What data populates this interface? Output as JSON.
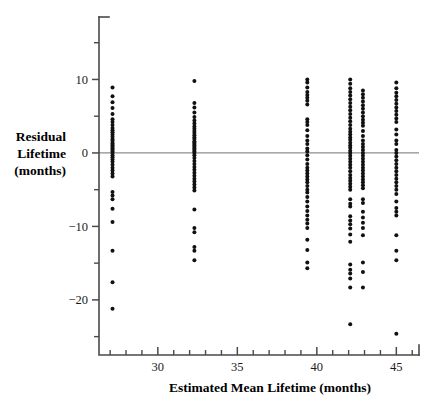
{
  "chart_data": {
    "type": "scatter",
    "title": "",
    "xlabel": "Estimated Mean Lifetime (months)",
    "ylabel": "Residual Lifetime (months)",
    "ylabel_lines": [
      "Residual",
      "Lifetime",
      "(months)"
    ],
    "xlim": [
      26.3,
      46.3
    ],
    "ylim": [
      -27.5,
      18.5
    ],
    "grid": false,
    "legend": null,
    "reference_lines": [
      {
        "orientation": "horizontal",
        "value": 0,
        "color": "#8d8d8d"
      }
    ],
    "xticks_major": [
      30,
      35,
      40,
      45
    ],
    "xticks_major_labels": [
      "30",
      "35",
      "40",
      "45"
    ],
    "xticks_minor": [
      27,
      28,
      29,
      31,
      32,
      33,
      34,
      36,
      37,
      38,
      39,
      41,
      42,
      43,
      44,
      46
    ],
    "yticks_major": [
      10,
      0,
      -10,
      -20
    ],
    "yticks_major_labels": [
      "10",
      "0",
      "−10",
      "−20"
    ],
    "yticks_minor": [
      15,
      5,
      -5,
      -15,
      -25
    ],
    "point_color": "#111111",
    "point_radius": 2.0,
    "series": [
      {
        "name": "Group 27.1",
        "x": 27.15,
        "values": [
          8.9,
          7.7,
          6.9,
          6.1,
          5.3,
          4.6,
          4.2,
          3.8,
          3.4,
          3.1,
          2.8,
          2.5,
          2.2,
          1.9,
          1.7,
          1.4,
          1.2,
          1.0,
          0.8,
          0.6,
          0.4,
          0.2,
          0.0,
          -0.3,
          -0.6,
          -0.9,
          -1.2,
          -1.6,
          -2.0,
          -2.4,
          -2.8,
          -3.2,
          -5.3,
          -5.8,
          -6.3,
          -7.6,
          -9.4,
          -13.3,
          -17.6,
          -21.2
        ]
      },
      {
        "name": "Group 32.3",
        "x": 32.3,
        "values": [
          9.8,
          6.8,
          6.2,
          5.5,
          4.9,
          4.4,
          4.0,
          3.6,
          3.3,
          3.0,
          2.7,
          2.4,
          2.1,
          1.9,
          1.6,
          1.4,
          1.2,
          1.0,
          0.8,
          0.6,
          0.4,
          0.2,
          0.0,
          -0.3,
          -0.7,
          -1.1,
          -1.5,
          -1.9,
          -2.3,
          -2.7,
          -3.1,
          -3.5,
          -3.9,
          -4.3,
          -4.7,
          -5.1,
          -7.7,
          -10.2,
          -10.8,
          -12.8,
          -13.3,
          -14.6
        ]
      },
      {
        "name": "Group 39.4",
        "x": 39.4,
        "values": [
          10.0,
          9.6,
          8.9,
          8.3,
          7.9,
          7.5,
          7.1,
          6.6,
          4.6,
          4.2,
          3.8,
          3.1,
          2.3,
          1.7,
          1.2,
          0.6,
          0.2,
          -0.3,
          -0.9,
          -1.5,
          -2.0,
          -2.4,
          -2.8,
          -3.2,
          -3.6,
          -4.0,
          -4.5,
          -5.0,
          -5.4,
          -6.0,
          -6.6,
          -7.3,
          -7.9,
          -8.5,
          -9.1,
          -9.6,
          -10.2,
          -11.8,
          -13.2,
          -14.9,
          -15.7
        ]
      },
      {
        "name": "Group 42.1",
        "x": 42.1,
        "values": [
          10.0,
          9.4,
          8.8,
          8.3,
          7.8,
          7.3,
          6.8,
          6.3,
          5.8,
          5.3,
          4.8,
          4.3,
          3.8,
          3.3,
          2.9,
          2.5,
          2.1,
          1.8,
          1.4,
          1.0,
          0.7,
          0.3,
          0.0,
          -0.4,
          -0.8,
          -1.2,
          -1.6,
          -2.0,
          -2.5,
          -3.0,
          -3.4,
          -3.8,
          -4.2,
          -4.6,
          -5.0,
          -6.3,
          -6.9,
          -7.3,
          -8.6,
          -9.2,
          -9.7,
          -10.3,
          -11.1,
          -12.1,
          -15.2,
          -15.9,
          -16.4,
          -17.1,
          -18.3,
          -23.3
        ]
      },
      {
        "name": "Group 42.9",
        "x": 42.9,
        "values": [
          8.5,
          8.0,
          7.5,
          7.0,
          6.5,
          6.0,
          5.5,
          5.0,
          4.5,
          4.1,
          3.7,
          3.0,
          2.3,
          1.7,
          1.2,
          0.8,
          0.4,
          0.0,
          -0.4,
          -0.8,
          -1.2,
          -1.6,
          -2.0,
          -2.4,
          -2.8,
          -3.2,
          -3.6,
          -4.0,
          -4.4,
          -4.8,
          -6.3,
          -6.8,
          -8.0,
          -8.8,
          -9.5,
          -10.2,
          -11.2,
          -14.9,
          -16.2,
          -18.3
        ]
      },
      {
        "name": "Group 45.0",
        "x": 45.0,
        "values": [
          9.6,
          8.8,
          8.2,
          7.7,
          7.2,
          6.7,
          6.2,
          5.7,
          5.2,
          4.7,
          4.2,
          3.2,
          2.5,
          1.7,
          1.2,
          0.4,
          0.0,
          -0.5,
          -1.0,
          -1.5,
          -2.0,
          -2.5,
          -3.0,
          -3.5,
          -4.0,
          -4.5,
          -5.0,
          -5.6,
          -6.6,
          -7.5,
          -8.0,
          -8.5,
          -11.2,
          -13.3,
          -14.6,
          -24.6
        ]
      }
    ]
  }
}
